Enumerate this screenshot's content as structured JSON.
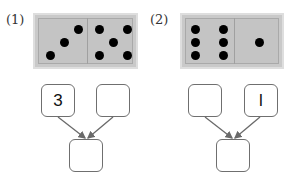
{
  "problems": [
    {
      "label": "(1)",
      "domino": {
        "left_pips": 3,
        "right_pips": 5
      },
      "boxes": {
        "top_left": "3",
        "top_right": "",
        "bottom": ""
      }
    },
    {
      "label": "(2)",
      "domino": {
        "left_pips": 6,
        "right_pips": 1
      },
      "boxes": {
        "top_left": "",
        "top_right": "l",
        "bottom": ""
      }
    }
  ],
  "colors": {
    "domino_fill": "#c4c4c4",
    "pip": "#000000",
    "box_border": "#6f6f6f",
    "arrow": "#6a6a6a"
  }
}
